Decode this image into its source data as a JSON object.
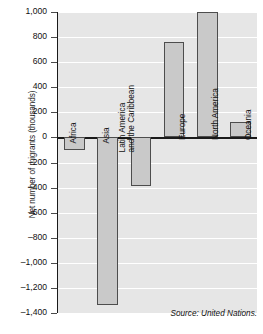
{
  "chart_data": {
    "type": "bar",
    "title": "",
    "xlabel": "",
    "ylabel": "Net number of migrants (thousands)",
    "categories": [
      "Africa",
      "Asia",
      "Latin America and the Caribbean",
      "Europe",
      "North America",
      "Oceania"
    ],
    "values": [
      -100,
      -1340,
      -390,
      760,
      1000,
      120
    ],
    "ylim": [
      -1400,
      1000
    ],
    "ytick_step": 200,
    "ytick_labels": [
      "1,000",
      "800",
      "600",
      "400",
      "200",
      "0",
      "–200",
      "–400",
      "–600",
      "–800",
      "–1,000",
      "–1,200",
      "–1,400"
    ],
    "ytick_values": [
      1000,
      800,
      600,
      400,
      200,
      0,
      -200,
      -400,
      -600,
      -800,
      -1000,
      -1200,
      -1400
    ],
    "grid": true,
    "legend": "none",
    "annotations": [
      "Source: United Nations."
    ],
    "colors": {
      "bar_fill": "#c9c9c9",
      "bar_stroke": "#4d4d4d",
      "plot_background": "#e6e6e6",
      "gridline": "#ffffff",
      "axis": "#1a1a1a",
      "text": "#111111"
    }
  },
  "source_note": "Source: United Nations."
}
